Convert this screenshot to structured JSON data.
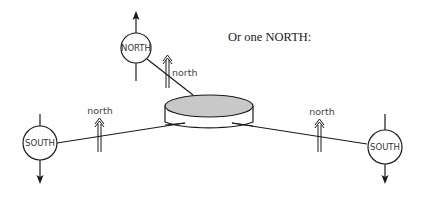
{
  "caption": "Or one NORTH:",
  "central_node": {
    "shape": "cylinder",
    "top_fill": "#c8c8c8"
  },
  "nodes": [
    {
      "id": "north-node",
      "label": "NORTH",
      "arrow": "up"
    },
    {
      "id": "south-node-left",
      "label": "SOUTH",
      "arrow": "down"
    },
    {
      "id": "south-node-right",
      "label": "SOUTH",
      "arrow": "down"
    }
  ],
  "flows": [
    {
      "id": "flow-north-node",
      "label": "north",
      "direction": "up"
    },
    {
      "id": "flow-left",
      "label": "north",
      "direction": "up"
    },
    {
      "id": "flow-right",
      "label": "north",
      "direction": "up"
    }
  ],
  "colors": {
    "line": "#1a1a1a",
    "cylinder_top": "#c8c8c8",
    "background": "#ffffff"
  }
}
